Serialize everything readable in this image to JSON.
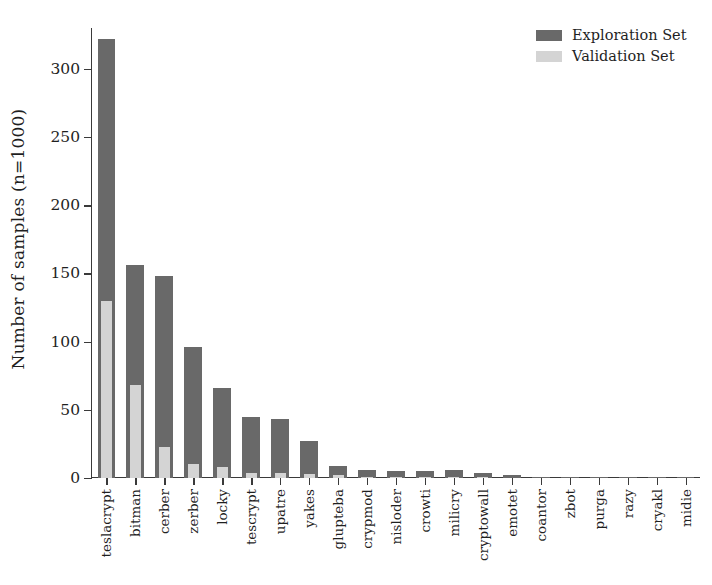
{
  "chart_data": {
    "type": "bar",
    "title": "",
    "xlabel": "",
    "ylabel": "Number of samples (n=1000)",
    "ylim": [
      0,
      330
    ],
    "yticks": [
      0,
      50,
      100,
      150,
      200,
      250,
      300
    ],
    "grid": false,
    "legend_position": "upper right",
    "bar_style": "overlaid",
    "categories": [
      "teslacrypt",
      "bitman",
      "cerber",
      "zerber",
      "locky",
      "tescrypt",
      "upatre",
      "yakes",
      "glupteba",
      "crypmod",
      "nisloder",
      "crowti",
      "milicry",
      "cryptowall",
      "emotet",
      "coantor",
      "zbot",
      "purga",
      "razy",
      "cryakl",
      "midie"
    ],
    "series": [
      {
        "name": "Exploration Set",
        "color": "#696969",
        "values": [
          322,
          156,
          148,
          96,
          66,
          45,
          43,
          27,
          9,
          6,
          5,
          5,
          6,
          4,
          2,
          1,
          1,
          1,
          1,
          1,
          1
        ]
      },
      {
        "name": "Validation Set",
        "color": "#d4d4d4",
        "values": [
          130,
          68,
          23,
          10,
          8,
          4,
          4,
          3,
          2,
          1,
          1,
          1,
          1,
          1,
          0,
          0,
          0,
          0,
          0,
          0,
          0
        ]
      }
    ]
  },
  "legend": {
    "items": [
      {
        "label": "Exploration Set",
        "color": "#696969"
      },
      {
        "label": "Validation Set",
        "color": "#d4d4d4"
      }
    ]
  },
  "axes": {
    "y_title": "Number of samples (n=1000)",
    "y_tick_labels": [
      "0",
      "50",
      "100",
      "150",
      "200",
      "250",
      "300"
    ]
  }
}
